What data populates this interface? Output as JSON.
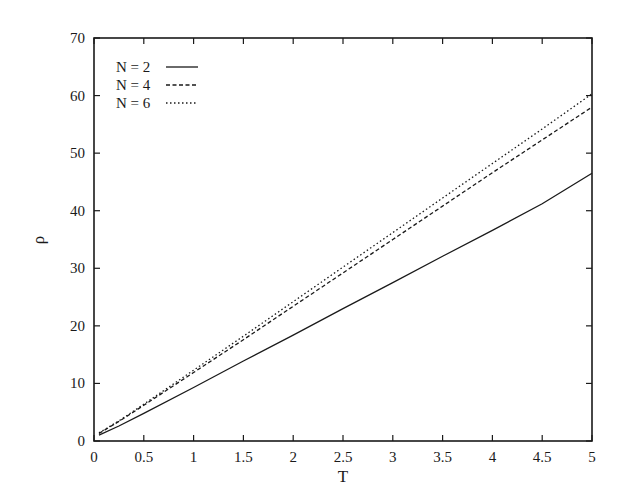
{
  "chart_data": {
    "type": "line",
    "title": "",
    "xlabel": "T",
    "ylabel": "ρ",
    "xlim": [
      0,
      5
    ],
    "ylim": [
      0,
      70
    ],
    "xticks": [
      0,
      0.5,
      1,
      1.5,
      2,
      2.5,
      3,
      3.5,
      4,
      4.5,
      5
    ],
    "xtick_labels": [
      "0",
      "0.5",
      "1",
      "1.5",
      "2",
      "2.5",
      "3",
      "3.5",
      "4",
      "4.5",
      "5"
    ],
    "yticks": [
      0,
      10,
      20,
      30,
      40,
      50,
      60,
      70
    ],
    "ytick_labels": [
      "0",
      "10",
      "20",
      "30",
      "40",
      "50",
      "60",
      "70"
    ],
    "grid": false,
    "legend_position": "upper left",
    "x": [
      0.05,
      0.25,
      0.5,
      1,
      1.5,
      2,
      2.5,
      3,
      3.5,
      4,
      4.5,
      5
    ],
    "series": [
      {
        "name": "N = 2",
        "style": "solid",
        "values": [
          1.0,
          2.6,
          4.8,
          9.3,
          13.9,
          18.4,
          23.0,
          27.5,
          32.1,
          36.6,
          41.2,
          46.5
        ]
      },
      {
        "name": "N = 4",
        "style": "dashed",
        "values": [
          1.3,
          3.4,
          6.2,
          11.9,
          17.6,
          23.4,
          29.2,
          35.0,
          40.8,
          46.6,
          52.3,
          58.0
        ]
      },
      {
        "name": "N = 6",
        "style": "dotted",
        "values": [
          1.4,
          3.5,
          6.4,
          12.3,
          18.2,
          24.2,
          30.2,
          36.2,
          42.2,
          48.2,
          54.2,
          60.3
        ]
      }
    ]
  }
}
